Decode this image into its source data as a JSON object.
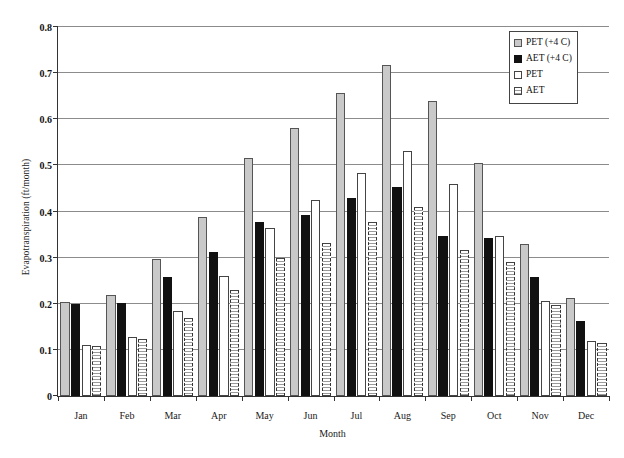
{
  "chart_data": {
    "type": "bar",
    "title": "",
    "xlabel": "Month",
    "ylabel": "Evapotranspiration (ft/month)",
    "ylim": [
      0,
      0.8
    ],
    "ytick_labels": [
      "0",
      "0.1",
      "0.2",
      "0.3",
      "0.4",
      "0.5",
      "0.6",
      "0.7",
      "0.8"
    ],
    "ytick_values": [
      0,
      0.1,
      0.2,
      0.3,
      0.4,
      0.5,
      0.6,
      0.7,
      0.8
    ],
    "grid": "horizontal",
    "legend_position": "top-right",
    "categories": [
      "Jan",
      "Feb",
      "Mar",
      "Apr",
      "May",
      "Jun",
      "Jul",
      "Aug",
      "Sep",
      "Oct",
      "Nov",
      "Dec"
    ],
    "series": [
      {
        "name": "PET (+4 C)",
        "style": "light-gray-solid",
        "values": [
          0.204,
          0.218,
          0.297,
          0.388,
          0.515,
          0.58,
          0.656,
          0.717,
          0.639,
          0.505,
          0.329,
          0.213
        ]
      },
      {
        "name": "AET (+4 C)",
        "style": "black-solid",
        "values": [
          0.199,
          0.202,
          0.259,
          0.313,
          0.378,
          0.393,
          0.43,
          0.454,
          0.348,
          0.343,
          0.258,
          0.163
        ]
      },
      {
        "name": "PET",
        "style": "white-outline",
        "values": [
          0.111,
          0.128,
          0.184,
          0.261,
          0.364,
          0.424,
          0.484,
          0.531,
          0.46,
          0.346,
          0.206,
          0.12
        ]
      },
      {
        "name": "AET",
        "style": "white-dotted",
        "values": [
          0.108,
          0.123,
          0.169,
          0.229,
          0.299,
          0.332,
          0.377,
          0.41,
          0.317,
          0.29,
          0.198,
          0.116
        ]
      }
    ]
  }
}
